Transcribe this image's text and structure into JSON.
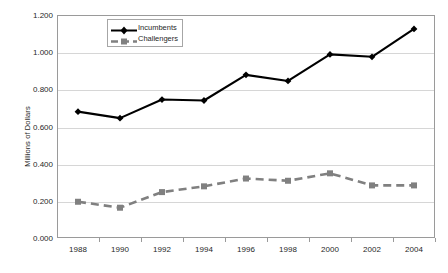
{
  "chart_data": {
    "type": "line",
    "title": "",
    "subtitle": "",
    "xlabel": "",
    "ylabel": "Millions of Dollars",
    "categories": [
      "1988",
      "1990",
      "1992",
      "1994",
      "1996",
      "1998",
      "2000",
      "2002",
      "2004"
    ],
    "x": [
      1988,
      1990,
      1992,
      1994,
      1996,
      1998,
      2000,
      2002,
      2004
    ],
    "series": [
      {
        "name": "Incumbents",
        "values": [
          0.68,
          0.645,
          0.745,
          0.74,
          0.878,
          0.845,
          0.988,
          0.975,
          1.125
        ],
        "color": "#000000",
        "line_style": "solid",
        "marker": "diamond"
      },
      {
        "name": "Challengers",
        "values": [
          0.195,
          0.163,
          0.247,
          0.278,
          0.32,
          0.308,
          0.348,
          0.283,
          0.283
        ],
        "color": "#808080",
        "line_style": "dashed",
        "marker": "square"
      }
    ],
    "ylim": [
      0.0,
      1.2
    ],
    "ytick_values": [
      0.0,
      0.2,
      0.4,
      0.6,
      0.8,
      1.0,
      1.2
    ],
    "ytick_labels": [
      "0.000",
      "0.200",
      "0.400",
      "0.600",
      "0.800",
      "1.000",
      "1.200"
    ],
    "grid": true,
    "grid_axis": "y",
    "legend_position": "upper-left-inside",
    "plot_background": "#ffffff",
    "grid_color": "#d6d6d6",
    "frame_color": "#9a9a9a"
  }
}
